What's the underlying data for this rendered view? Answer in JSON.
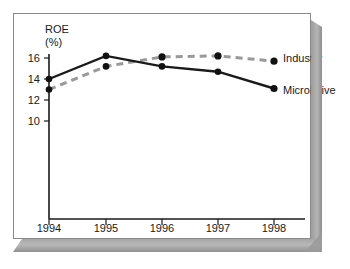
{
  "figure": {
    "y_axis_title_line1": "ROE",
    "y_axis_title_line2": "(%)",
    "series_labels": {
      "industry": "Industry",
      "microdrive": "MicroDrive"
    },
    "colors": {
      "microdrive_line": "#1a1a1a",
      "industry_line": "#999999",
      "marker": "#111111",
      "axis": "#1a1a1a",
      "frame_border": "#8a8a8a",
      "bevel": "#a8a8a8",
      "background": "#ffffff"
    }
  },
  "chart_data": {
    "type": "line",
    "title": "",
    "xlabel": "",
    "ylabel": "ROE (%)",
    "categories": [
      "1994",
      "1995",
      "1996",
      "1997",
      "1998"
    ],
    "x_tick_labels": [
      "1994",
      "1995",
      "1996",
      "1997",
      "1998"
    ],
    "y_tick_labels": [
      "16",
      "14",
      "12",
      "10"
    ],
    "y_ticks": [
      16,
      14,
      12,
      10
    ],
    "ylim": [
      9,
      17
    ],
    "grid": false,
    "legend_position": "right-inline",
    "series": [
      {
        "name": "MicroDrive",
        "style": "solid",
        "color": "#1a1a1a",
        "marker": "circle",
        "values": [
          14.0,
          16.2,
          15.2,
          14.7,
          13.1
        ]
      },
      {
        "name": "Industry",
        "style": "dashed",
        "color": "#999999",
        "marker": "circle",
        "values": [
          13.0,
          15.2,
          16.1,
          16.2,
          15.7
        ]
      }
    ]
  }
}
